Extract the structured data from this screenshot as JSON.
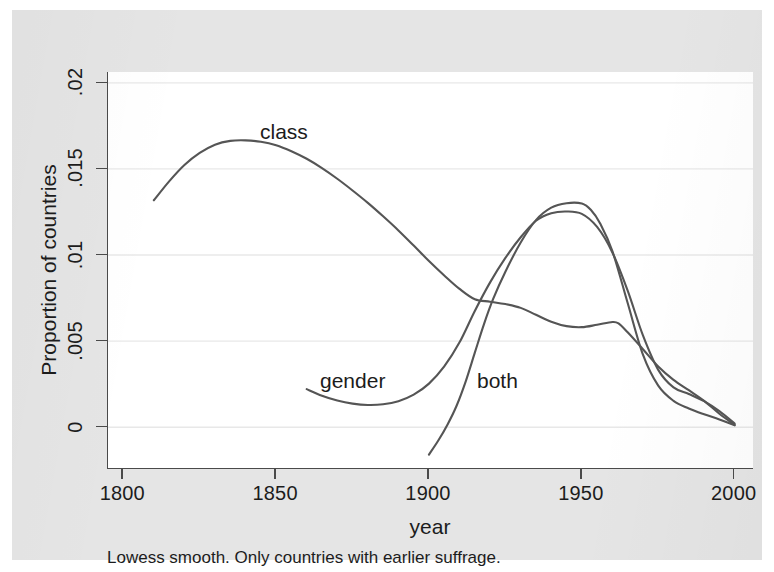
{
  "figure": {
    "caption": "Lowess smooth. Only countries with earlier suffrage.",
    "x_axis_title": "year",
    "y_axis_title": "Proportion of countries",
    "colors": {
      "page_background": "#ffffff",
      "panel_background": "#e5e5e5",
      "plot_background": "#ffffff",
      "axis": "#4a4a4a",
      "gridline": "#e8e8e8",
      "line": "#555555",
      "text": "#1c1c1c"
    }
  },
  "chart_data": {
    "type": "line",
    "title": "",
    "subtitle": "",
    "xlabel": "year",
    "ylabel": "Proportion of countries",
    "caption": "Lowess smooth. Only countries with earlier suffrage.",
    "xlim": [
      1795,
      2006
    ],
    "ylim": [
      -0.0024,
      0.0206
    ],
    "xticks": [
      1800,
      1850,
      1900,
      1950,
      2000
    ],
    "xtick_labels": [
      "1800",
      "1850",
      "1900",
      "1950",
      "2000"
    ],
    "yticks": [
      0,
      0.005,
      0.01,
      0.015,
      0.02
    ],
    "ytick_labels": [
      "0",
      ".005",
      ".01",
      ".015",
      ".02"
    ],
    "grid": "horizontal",
    "legend": "inline-annotations",
    "annotations": [
      {
        "text": "class",
        "x": 1852,
        "y": 0.0176
      },
      {
        "text": "gender",
        "x": 1870,
        "y": 0.0031
      },
      {
        "text": "both",
        "x": 1921,
        "y": 0.0031
      }
    ],
    "series": [
      {
        "name": "class",
        "x": [
          1810,
          1815,
          1820,
          1825,
          1830,
          1835,
          1840,
          1845,
          1850,
          1855,
          1860,
          1865,
          1870,
          1875,
          1880,
          1885,
          1890,
          1895,
          1900,
          1905,
          1910,
          1915,
          1920,
          1925,
          1930,
          1935,
          1940,
          1945,
          1950,
          1955,
          1960,
          1962,
          1965,
          1970,
          1975,
          1980,
          1985,
          1990,
          1995,
          2000
        ],
        "y": [
          0.01315,
          0.01425,
          0.0152,
          0.0159,
          0.01638,
          0.0166,
          0.01663,
          0.01655,
          0.01635,
          0.016,
          0.01556,
          0.01502,
          0.0144,
          0.01372,
          0.013,
          0.01222,
          0.0114,
          0.01052,
          0.00962,
          0.00878,
          0.008,
          0.0074,
          0.00726,
          0.00712,
          0.0069,
          0.0065,
          0.0061,
          0.00584,
          0.00578,
          0.00592,
          0.00608,
          0.006,
          0.00548,
          0.0045,
          0.0035,
          0.00272,
          0.00212,
          0.0015,
          0.00075,
          0.0001
        ]
      },
      {
        "name": "gender",
        "x": [
          1860,
          1865,
          1870,
          1875,
          1880,
          1885,
          1890,
          1895,
          1900,
          1905,
          1910,
          1915,
          1920,
          1925,
          1930,
          1935,
          1940,
          1945,
          1950,
          1955,
          1960,
          1965,
          1970,
          1975,
          1980,
          1985,
          1990,
          1995,
          2000
        ],
        "y": [
          0.00218,
          0.0018,
          0.00152,
          0.00134,
          0.00126,
          0.0013,
          0.00148,
          0.00186,
          0.0025,
          0.0035,
          0.0049,
          0.00672,
          0.00838,
          0.0098,
          0.011,
          0.01196,
          0.0124,
          0.0125,
          0.01236,
          0.0116,
          0.01012,
          0.0079,
          0.0053,
          0.0033,
          0.00228,
          0.0019,
          0.00148,
          0.0009,
          0.00018
        ]
      },
      {
        "name": "both",
        "x": [
          1900,
          1903,
          1906,
          1909,
          1912,
          1915,
          1918,
          1921,
          1925,
          1930,
          1935,
          1940,
          1945,
          1950,
          1953,
          1956,
          1960,
          1965,
          1970,
          1975,
          1980,
          1985,
          1990,
          1995,
          2000
        ],
        "y": [
          -0.00162,
          -0.00082,
          0.0001,
          0.0012,
          0.00262,
          0.0043,
          0.00596,
          0.00742,
          0.009,
          0.0107,
          0.012,
          0.01272,
          0.01298,
          0.01296,
          0.01258,
          0.0118,
          0.0102,
          0.00718,
          0.00418,
          0.00238,
          0.0015,
          0.00106,
          0.00072,
          0.00042,
          8e-05
        ]
      }
    ]
  }
}
